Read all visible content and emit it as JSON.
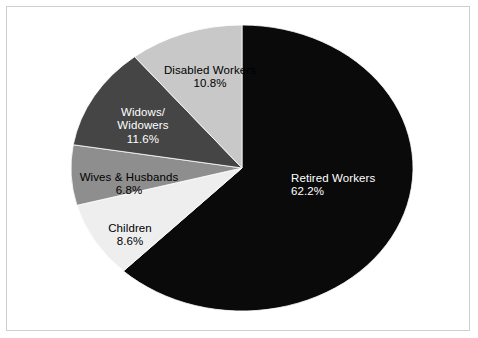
{
  "chart_data": {
    "type": "pie",
    "title": "",
    "subtitle": "",
    "xlabel": "",
    "ylabel": "",
    "legend_position": "none",
    "labels_inside_slices": true,
    "start_angle_deg": -90,
    "direction": "clockwise",
    "categories": [
      "Retired Workers",
      "Children",
      "Wives & Husbands",
      "Widows/\nWidowers",
      "Disabled Workers"
    ],
    "values": [
      62.2,
      8.6,
      6.8,
      11.6,
      10.8
    ],
    "value_suffix": "%",
    "colors": [
      "#0a0a0a",
      "#eeeeee",
      "#8e8e8e",
      "#454545",
      "#c8c8c8"
    ],
    "slices": [
      {
        "name": "Retired Workers",
        "label": "Retired Workers",
        "percent": 62.2,
        "percent_text": "62.2%",
        "color": "#0a0a0a",
        "text_color": "#ffffff"
      },
      {
        "name": "Children",
        "label": "Children",
        "percent": 8.6,
        "percent_text": "8.6%",
        "color": "#eeeeee",
        "text_color": "#000000"
      },
      {
        "name": "Wives & Husbands",
        "label": "Wives & Husbands",
        "percent": 6.8,
        "percent_text": "6.8%",
        "color": "#8e8e8e",
        "text_color": "#000000"
      },
      {
        "name": "Widows/Widowers",
        "label": "Widows/\nWidowers",
        "percent": 11.6,
        "percent_text": "11.6%",
        "color": "#454545",
        "text_color": "#ffffff"
      },
      {
        "name": "Disabled Workers",
        "label": "Disabled Workers",
        "percent": 10.8,
        "percent_text": "10.8%",
        "color": "#c8c8c8",
        "text_color": "#000000"
      }
    ],
    "geometry": {
      "center_x": 242,
      "center_y": 168,
      "radius_x": 171,
      "radius_y": 143
    },
    "frame_color": "#cfcfcf",
    "background": "#ffffff"
  }
}
